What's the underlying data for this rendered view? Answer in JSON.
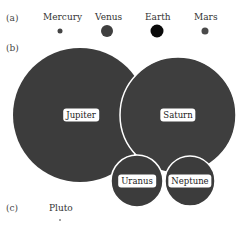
{
  "panels": {
    "a": {
      "label": "(a)"
    },
    "b": {
      "label": "(b)"
    },
    "c": {
      "label": "(c)"
    }
  },
  "terrestrial": [
    {
      "name": "Mercury",
      "label_x": 60,
      "cx": 60,
      "cy": 31,
      "r": 2.5,
      "color": "#444444"
    },
    {
      "name": "Venus",
      "label_x": 107,
      "cx": 107,
      "cy": 31,
      "r": 6,
      "color": "#3f3f3f"
    },
    {
      "name": "Earth",
      "label_x": 157,
      "cx": 157,
      "cy": 31,
      "r": 6.5,
      "color": "#0a0a0a"
    },
    {
      "name": "Mars",
      "label_x": 205,
      "cx": 205,
      "cy": 31,
      "r": 3.5,
      "color": "#4a4a4a"
    }
  ],
  "giants": [
    {
      "name": "Jupiter",
      "cx": 80,
      "cy": 115,
      "r": 67
    },
    {
      "name": "Saturn",
      "cx": 178,
      "cy": 115,
      "r": 58
    },
    {
      "name": "Uranus",
      "cx": 137,
      "cy": 181,
      "r": 26
    },
    {
      "name": "Neptune",
      "cx": 190,
      "cy": 181,
      "r": 25
    }
  ],
  "dwarf": {
    "name": "Pluto",
    "cx": 60,
    "cy": 220,
    "r": 0.8
  },
  "colors": {
    "planet_fill": "#3c3c3c",
    "outline": "#ffffff"
  }
}
